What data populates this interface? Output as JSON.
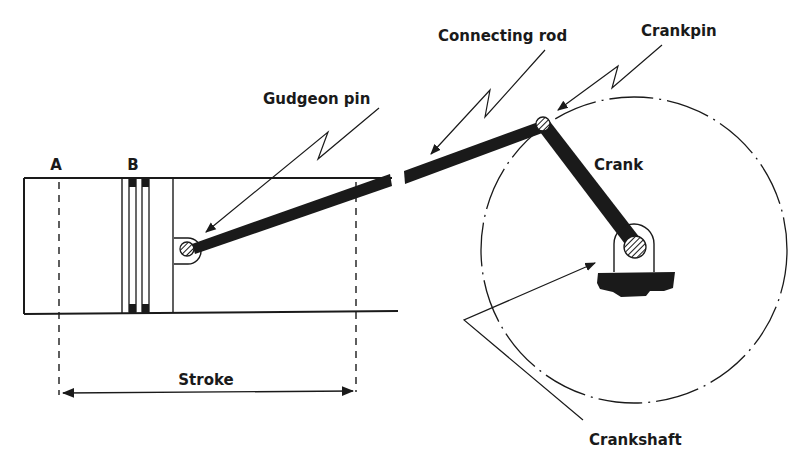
{
  "diagram": {
    "labels": {
      "position_a": "A",
      "position_b": "B",
      "gudgeon_pin": "Gudgeon pin",
      "connecting_rod": "Connecting rod",
      "crankpin": "Crankpin",
      "crank": "Crank",
      "crankshaft": "Crankshaft",
      "stroke": "Stroke"
    },
    "colors": {
      "ink": "#1a1a1a",
      "background": "#ffffff"
    },
    "components": [
      {
        "id": "cylinder",
        "description": "Open-ended cylinder bore outline"
      },
      {
        "id": "piston",
        "description": "Piston with two compression rings"
      },
      {
        "id": "gudgeon_pin",
        "description": "Hatched pin in piston boss"
      },
      {
        "id": "connecting_rod",
        "description": "Thick black rod, shown broken"
      },
      {
        "id": "crankpin",
        "description": "Hatched pin at rod/crank joint"
      },
      {
        "id": "crank",
        "description": "Thick black crank arm"
      },
      {
        "id": "crankshaft",
        "description": "Hatched shaft in bearing block"
      },
      {
        "id": "crank_circle",
        "description": "Dash-dot circle traced by crankpin"
      },
      {
        "id": "stroke_dimension",
        "description": "Double-headed arrow between dead centres"
      }
    ]
  }
}
